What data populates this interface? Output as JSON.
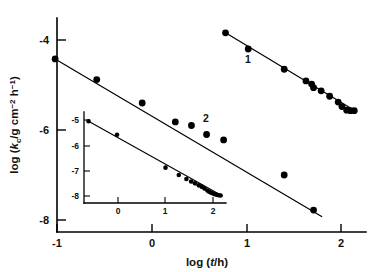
{
  "figure": {
    "background_color": "#ffffff",
    "ink_color": "#000000"
  },
  "chart_data": {
    "type": "scatter",
    "title": "",
    "subtitle": "",
    "xlabel": "log (t/h)",
    "ylabel": "log (k_c/g cm^-2 h^-1)",
    "xlabel_parts": {
      "prefix": "log (",
      "italic_var": "t",
      "slash": "/h)"
    },
    "ylabel_parts": {
      "prefix": "log (",
      "italic_var": "k",
      "subscript": "c",
      "units_a": "/g cm",
      "superscript_a": "−2",
      "units_b": " h",
      "superscript_b": "−1",
      "suffix": ")"
    },
    "xlim": [
      -1.15,
      2.25
    ],
    "ylim": [
      -8.25,
      -3.55
    ],
    "xticks": [
      -1,
      0,
      1,
      2
    ],
    "xtick_labels": [
      "-1",
      "0",
      "1",
      "2"
    ],
    "yticks": [
      -4,
      -6,
      -8
    ],
    "ytick_labels": [
      "-4",
      "-6",
      "-8"
    ],
    "grid": false,
    "legend_position": "inline-annotations",
    "annotations": [
      {
        "text": "1",
        "x": 1.0,
        "y": -5.15,
        "name": "curve-1-label"
      },
      {
        "text": "2",
        "x": 0.56,
        "y": -5.45,
        "name": "curve-2-label"
      }
    ],
    "series": [
      {
        "name": "1",
        "marker": "filled-circle",
        "values": [
          [
            0.78,
            -3.84
          ],
          [
            1.02,
            -4.2
          ],
          [
            1.4,
            -4.65
          ],
          [
            1.63,
            -4.91
          ],
          [
            1.69,
            -4.98
          ],
          [
            1.71,
            -5.06
          ],
          [
            1.79,
            -5.13
          ],
          [
            1.88,
            -5.25
          ],
          [
            1.97,
            -5.38
          ],
          [
            2.01,
            -5.48
          ],
          [
            2.06,
            -5.56
          ],
          [
            2.1,
            -5.57
          ],
          [
            2.14,
            -5.57
          ]
        ],
        "fit_line": {
          "x0": 0.78,
          "y0": -3.84,
          "x1": 2.17,
          "y1": -5.6
        }
      },
      {
        "name": "2",
        "marker": "filled-circle",
        "values": [
          [
            -1.02,
            -4.42
          ],
          [
            -0.58,
            -4.88
          ],
          [
            -0.1,
            -5.4
          ],
          [
            0.25,
            -5.82
          ],
          [
            0.42,
            -5.9
          ],
          [
            0.58,
            -6.1
          ],
          [
            0.76,
            -6.22
          ],
          [
            1.4,
            -7.0
          ],
          [
            1.71,
            -7.78
          ]
        ],
        "fit_line": {
          "x0": -1.02,
          "y0": -4.42,
          "x1": 1.8,
          "y1": -7.93
        }
      }
    ],
    "inset": {
      "type": "scatter",
      "xlim": [
        -0.78,
        2.35
      ],
      "ylim": [
        -8.35,
        -4.8
      ],
      "xticks": [
        0,
        1,
        2
      ],
      "xtick_labels": [
        "0",
        "1",
        "2"
      ],
      "yticks": [
        -5,
        -6,
        -7,
        -8
      ],
      "ytick_labels": [
        "-5",
        "-6",
        "-7",
        "-8"
      ],
      "grid": false,
      "series": [
        {
          "name": "inset-series",
          "marker": "filled-circle",
          "values": [
            [
              -0.62,
              -5.05
            ],
            [
              -0.02,
              -5.58
            ],
            [
              1.0,
              -6.88
            ],
            [
              1.28,
              -7.17
            ],
            [
              1.44,
              -7.33
            ],
            [
              1.54,
              -7.43
            ],
            [
              1.62,
              -7.5
            ],
            [
              1.7,
              -7.58
            ],
            [
              1.76,
              -7.63
            ],
            [
              1.82,
              -7.7
            ],
            [
              1.88,
              -7.78
            ],
            [
              1.92,
              -7.83
            ],
            [
              1.96,
              -7.87
            ],
            [
              2.0,
              -7.9
            ],
            [
              2.04,
              -7.93
            ],
            [
              2.08,
              -7.95
            ],
            [
              2.12,
              -7.97
            ],
            [
              2.16,
              -7.98
            ]
          ],
          "fit_line": {
            "x0": -0.62,
            "y0": -5.05,
            "x1": 2.2,
            "y1": -8.0
          }
        }
      ]
    }
  }
}
